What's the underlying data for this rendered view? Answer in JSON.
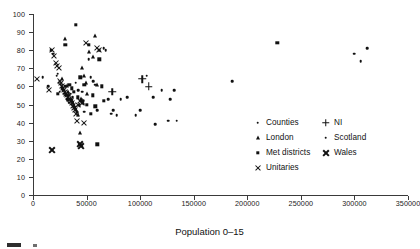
{
  "chart_data": {
    "type": "scatter",
    "title": "",
    "xlabel": "Population 0–15",
    "ylabel": "",
    "xlim": [
      0,
      350000
    ],
    "ylim": [
      0,
      100
    ],
    "grid": false,
    "legend_position": "inside-right",
    "xticks": [
      0,
      50000,
      100000,
      150000,
      200000,
      250000,
      300000,
      350000
    ],
    "xtick_labels": [
      "0",
      "50000",
      "100000",
      "150000",
      "200000",
      "250000",
      "300000",
      "350000"
    ],
    "yticks": [
      0,
      10,
      20,
      30,
      40,
      50,
      60,
      70,
      80,
      90,
      100
    ],
    "ytick_labels": [
      "0",
      "10",
      "20",
      "30",
      "40",
      "50",
      "60",
      "70",
      "80",
      "90",
      "100"
    ],
    "series": [
      {
        "name": "Counties",
        "marker": "dot",
        "points": [
          [
            9000,
            65
          ],
          [
            14000,
            60
          ],
          [
            17000,
            80
          ],
          [
            19000,
            78
          ],
          [
            22000,
            66
          ],
          [
            23000,
            67
          ],
          [
            24000,
            62
          ],
          [
            25000,
            57
          ],
          [
            26000,
            61
          ],
          [
            27000,
            59
          ],
          [
            28000,
            58
          ],
          [
            29000,
            56
          ],
          [
            30000,
            60
          ],
          [
            31000,
            55
          ],
          [
            32000,
            53
          ],
          [
            33000,
            52
          ],
          [
            34000,
            51
          ],
          [
            35000,
            56
          ],
          [
            36000,
            50
          ],
          [
            37000,
            54
          ],
          [
            38000,
            49
          ],
          [
            40000,
            62
          ],
          [
            42000,
            58
          ],
          [
            44000,
            52
          ],
          [
            46000,
            57
          ],
          [
            48000,
            46
          ],
          [
            52000,
            75
          ],
          [
            54000,
            65
          ],
          [
            56000,
            63
          ],
          [
            58000,
            61
          ],
          [
            60000,
            47
          ],
          [
            62000,
            80
          ],
          [
            66000,
            81
          ],
          [
            68000,
            80
          ],
          [
            70000,
            53
          ],
          [
            73000,
            45
          ],
          [
            75000,
            47
          ],
          [
            78000,
            44
          ],
          [
            82000,
            53
          ],
          [
            88000,
            54
          ],
          [
            96000,
            44
          ],
          [
            100000,
            47
          ],
          [
            106000,
            66
          ],
          [
            112000,
            54
          ],
          [
            114000,
            39
          ],
          [
            120000,
            58
          ],
          [
            126000,
            41
          ],
          [
            128000,
            53
          ],
          [
            132000,
            58
          ],
          [
            134000,
            41
          ]
        ]
      },
      {
        "name": "London",
        "marker": "triangle",
        "points": [
          [
            27000,
            64
          ],
          [
            30000,
            86
          ],
          [
            32000,
            60
          ],
          [
            33000,
            57
          ],
          [
            34000,
            55
          ],
          [
            35000,
            53
          ],
          [
            36000,
            52
          ],
          [
            37000,
            51
          ],
          [
            38000,
            49
          ],
          [
            39000,
            48
          ],
          [
            40000,
            47
          ],
          [
            41000,
            46
          ],
          [
            42000,
            44
          ],
          [
            43000,
            50
          ],
          [
            44000,
            34
          ],
          [
            45000,
            53
          ],
          [
            46000,
            70
          ],
          [
            47000,
            51
          ],
          [
            48000,
            66
          ],
          [
            49000,
            62
          ],
          [
            50000,
            56
          ],
          [
            52000,
            79
          ],
          [
            56000,
            76
          ],
          [
            58000,
            88
          ],
          [
            60000,
            61
          ]
        ]
      },
      {
        "name": "Met districts",
        "marker": "square",
        "points": [
          [
            23000,
            56
          ],
          [
            30000,
            83
          ],
          [
            34000,
            61
          ],
          [
            36000,
            59
          ],
          [
            38000,
            57
          ],
          [
            40000,
            94
          ],
          [
            42000,
            54
          ],
          [
            44000,
            65
          ],
          [
            46000,
            52
          ],
          [
            48000,
            61
          ],
          [
            50000,
            50
          ],
          [
            52000,
            83
          ],
          [
            54000,
            45
          ],
          [
            56000,
            55
          ],
          [
            58000,
            49
          ],
          [
            60000,
            28
          ],
          [
            62000,
            75
          ],
          [
            64000,
            60
          ],
          [
            66000,
            52
          ],
          [
            228000,
            84
          ]
        ]
      },
      {
        "name": "Unitaries",
        "marker": "x-thin",
        "points": [
          [
            4000,
            64
          ],
          [
            15000,
            58
          ],
          [
            18000,
            80
          ],
          [
            20000,
            77
          ],
          [
            21000,
            73
          ],
          [
            22000,
            71
          ],
          [
            24000,
            70
          ],
          [
            25000,
            63
          ],
          [
            26000,
            62
          ],
          [
            27000,
            60
          ],
          [
            28000,
            59
          ],
          [
            29000,
            58
          ],
          [
            30000,
            57
          ],
          [
            31000,
            56
          ],
          [
            32000,
            55
          ],
          [
            33000,
            54
          ],
          [
            34000,
            53
          ],
          [
            35000,
            52
          ],
          [
            36000,
            51
          ],
          [
            37000,
            49
          ],
          [
            38000,
            48
          ],
          [
            39000,
            47
          ],
          [
            40000,
            45
          ],
          [
            41000,
            41
          ],
          [
            42000,
            50
          ],
          [
            44000,
            52
          ],
          [
            46000,
            51
          ],
          [
            48000,
            40
          ],
          [
            49000,
            84
          ],
          [
            60000,
            81
          ],
          [
            62000,
            80
          ]
        ]
      },
      {
        "name": "Wales",
        "marker": "x-bold",
        "points": [
          [
            18000,
            25
          ],
          [
            44000,
            28
          ],
          [
            45000,
            27
          ]
        ]
      },
      {
        "name": "NI",
        "marker": "plus",
        "points": [
          [
            74000,
            57
          ],
          [
            102000,
            64
          ],
          [
            108000,
            60
          ]
        ]
      },
      {
        "name": "Scotland",
        "marker": "dot",
        "points": [
          [
            186000,
            63
          ],
          [
            300000,
            78
          ],
          [
            312000,
            81
          ],
          [
            306000,
            74
          ]
        ]
      }
    ],
    "legend": [
      {
        "label": "Counties",
        "marker": "dot"
      },
      {
        "label": "London",
        "marker": "triangle"
      },
      {
        "label": "Met districts",
        "marker": "square"
      },
      {
        "label": "Unitaries",
        "marker": "x-thin"
      },
      {
        "label": "NI",
        "marker": "plus"
      },
      {
        "label": "Scotland",
        "marker": "dot"
      },
      {
        "label": "Wales",
        "marker": "x-bold"
      }
    ],
    "colors": {
      "marker": "#111111",
      "axis": "#3a3a3a",
      "background": "#ffffff"
    }
  }
}
